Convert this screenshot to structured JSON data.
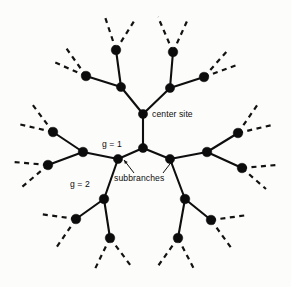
{
  "figure": {
    "type": "cayley-tree-diagram",
    "background_color": "#fcfcfb",
    "ink_color": "#0c0c0c",
    "width": 291,
    "height": 287
  },
  "labels": {
    "center_site": "center site",
    "generation_1": "g = 1",
    "generation_2": "g = 2",
    "subbranches": "subbranches"
  },
  "chart_data": {
    "type": "diagram",
    "title": "",
    "coordination_number": 3,
    "generations_drawn": 3,
    "nodes": [
      {
        "id": "center",
        "x": 143,
        "y": 114,
        "r": 4.6,
        "generation": 0,
        "label": "center site"
      },
      {
        "id": "g1",
        "x": 143,
        "y": 148,
        "r": 4.6,
        "generation": 1,
        "label": "g = 1"
      },
      {
        "id": "u-l",
        "x": 121,
        "y": 87,
        "r": 4.6,
        "generation": 1
      },
      {
        "id": "u-r",
        "x": 170,
        "y": 88,
        "r": 4.6,
        "generation": 1
      },
      {
        "id": "l-b",
        "x": 118,
        "y": 159,
        "r": 4.6,
        "generation": 2
      },
      {
        "id": "r-b",
        "x": 170,
        "y": 159,
        "r": 4.6,
        "generation": 2
      },
      {
        "id": "ul-up",
        "x": 116,
        "y": 50,
        "r": 4.8,
        "generation": 2
      },
      {
        "id": "ul-lf",
        "x": 86,
        "y": 76,
        "r": 4.8,
        "generation": 2
      },
      {
        "id": "ur-up",
        "x": 173,
        "y": 52,
        "r": 4.8,
        "generation": 2
      },
      {
        "id": "ur-rt",
        "x": 204,
        "y": 77,
        "r": 4.8,
        "generation": 2
      },
      {
        "id": "lb-lf",
        "x": 83,
        "y": 152,
        "r": 4.8,
        "generation": 3
      },
      {
        "id": "lb-dn",
        "x": 104,
        "y": 199,
        "r": 4.8,
        "generation": 3
      },
      {
        "id": "rb-rt",
        "x": 207,
        "y": 152,
        "r": 4.8,
        "generation": 3
      },
      {
        "id": "rb-dn",
        "x": 185,
        "y": 199,
        "r": 4.8,
        "generation": 3
      },
      {
        "id": "lbl-up",
        "x": 53,
        "y": 132,
        "r": 4.8,
        "generation": 4
      },
      {
        "id": "lbl-dn",
        "x": 48,
        "y": 165,
        "r": 4.8,
        "generation": 4
      },
      {
        "id": "rbr-up",
        "x": 238,
        "y": 133,
        "r": 4.8,
        "generation": 4
      },
      {
        "id": "rbr-dn",
        "x": 242,
        "y": 168,
        "r": 4.8,
        "generation": 4
      },
      {
        "id": "lbd-lf",
        "x": 76,
        "y": 219,
        "r": 4.8,
        "generation": 4
      },
      {
        "id": "lbd-dn",
        "x": 110,
        "y": 238,
        "r": 4.8,
        "generation": 4
      },
      {
        "id": "rbd-rt",
        "x": 211,
        "y": 220,
        "r": 4.8,
        "generation": 4
      },
      {
        "id": "rbd-dn",
        "x": 178,
        "y": 238,
        "r": 4.8,
        "generation": 4
      }
    ],
    "edges": [
      [
        "center",
        "g1"
      ],
      [
        "center",
        "u-l"
      ],
      [
        "center",
        "u-r"
      ],
      [
        "g1",
        "l-b"
      ],
      [
        "g1",
        "r-b"
      ],
      [
        "u-l",
        "ul-up"
      ],
      [
        "u-l",
        "ul-lf"
      ],
      [
        "u-r",
        "ur-up"
      ],
      [
        "u-r",
        "ur-rt"
      ],
      [
        "l-b",
        "lb-lf"
      ],
      [
        "l-b",
        "lb-dn"
      ],
      [
        "r-b",
        "rb-rt"
      ],
      [
        "r-b",
        "rb-dn"
      ],
      [
        "lb-lf",
        "lbl-up"
      ],
      [
        "lb-lf",
        "lbl-dn"
      ],
      [
        "rb-rt",
        "rbr-up"
      ],
      [
        "rb-rt",
        "rbr-dn"
      ],
      [
        "lb-dn",
        "lbd-lf"
      ],
      [
        "lb-dn",
        "lbd-dn"
      ],
      [
        "rb-dn",
        "rbd-rt"
      ],
      [
        "rb-dn",
        "rbd-dn"
      ]
    ],
    "dashed_stubs": [
      {
        "from": [
          116,
          50
        ],
        "to": [
          104,
          14
        ]
      },
      {
        "from": [
          116,
          50
        ],
        "to": [
          136,
          18
        ]
      },
      {
        "from": [
          173,
          52
        ],
        "to": [
          158,
          17
        ]
      },
      {
        "from": [
          173,
          52
        ],
        "to": [
          188,
          19
        ]
      },
      {
        "from": [
          86,
          76
        ],
        "to": [
          54,
          62
        ]
      },
      {
        "from": [
          86,
          76
        ],
        "to": [
          64,
          45
        ]
      },
      {
        "from": [
          204,
          77
        ],
        "to": [
          228,
          50
        ]
      },
      {
        "from": [
          204,
          77
        ],
        "to": [
          237,
          65
        ]
      },
      {
        "from": [
          53,
          132
        ],
        "to": [
          18,
          124
        ]
      },
      {
        "from": [
          53,
          132
        ],
        "to": [
          32,
          104
        ]
      },
      {
        "from": [
          48,
          165
        ],
        "to": [
          14,
          162
        ]
      },
      {
        "from": [
          48,
          165
        ],
        "to": [
          22,
          187
        ]
      },
      {
        "from": [
          238,
          133
        ],
        "to": [
          272,
          125
        ]
      },
      {
        "from": [
          238,
          133
        ],
        "to": [
          258,
          104
        ]
      },
      {
        "from": [
          242,
          168
        ],
        "to": [
          276,
          165
        ]
      },
      {
        "from": [
          242,
          168
        ],
        "to": [
          266,
          189
        ]
      },
      {
        "from": [
          76,
          219
        ],
        "to": [
          40,
          214
        ]
      },
      {
        "from": [
          76,
          219
        ],
        "to": [
          56,
          248
        ]
      },
      {
        "from": [
          110,
          238
        ],
        "to": [
          94,
          271
        ]
      },
      {
        "from": [
          110,
          238
        ],
        "to": [
          131,
          266
        ]
      },
      {
        "from": [
          178,
          238
        ],
        "to": [
          158,
          266
        ]
      },
      {
        "from": [
          178,
          238
        ],
        "to": [
          195,
          271
        ]
      },
      {
        "from": [
          211,
          220
        ],
        "to": [
          248,
          215
        ]
      },
      {
        "from": [
          211,
          220
        ],
        "to": [
          232,
          249
        ]
      }
    ],
    "annotation_arrows": [
      {
        "label": "subbranches",
        "from": [
          134,
          173
        ],
        "to": [
          124,
          160
        ]
      },
      {
        "label": "subbranches",
        "from": [
          163,
          173
        ],
        "to": [
          173,
          160
        ]
      }
    ]
  }
}
